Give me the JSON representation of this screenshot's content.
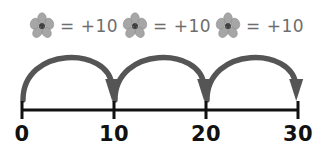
{
  "diagram": {
    "type": "number-line-skip-counting",
    "background_color": "#ffffff",
    "colors": {
      "arc": "#555555",
      "axis": "#111111",
      "legend_text": "#6e6e6e",
      "axis_label": "#111111",
      "flower_petal": "#a6a6a6",
      "flower_petal_edge": "#8a8a8a",
      "flower_center": "#4a4a4a"
    },
    "legend": {
      "items": [
        {
          "icon": "flower-icon",
          "text": "= +10",
          "value": 10
        },
        {
          "icon": "flower-icon",
          "text": "= +10",
          "value": 10
        },
        {
          "icon": "flower-icon",
          "text": "= +10",
          "value": 10
        }
      ]
    },
    "number_line": {
      "ticks": [
        {
          "label": "0",
          "value": 0
        },
        {
          "label": "10",
          "value": 10
        },
        {
          "label": "20",
          "value": 20
        },
        {
          "label": "30",
          "value": 30
        }
      ],
      "range": [
        0,
        30
      ],
      "step": 10
    },
    "jumps": [
      {
        "from": 0,
        "to": 10,
        "label": "+10",
        "direction": "right"
      },
      {
        "from": 10,
        "to": 20,
        "label": "+10",
        "direction": "right"
      },
      {
        "from": 20,
        "to": 30,
        "label": "+10",
        "direction": "right"
      }
    ]
  }
}
